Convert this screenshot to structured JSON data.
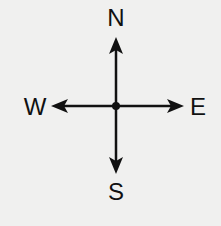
{
  "compass": {
    "labels": {
      "north": "N",
      "south": "S",
      "east": "E",
      "west": "W"
    },
    "colors": {
      "background": "#f0f0ef",
      "stroke": "#111111"
    }
  }
}
